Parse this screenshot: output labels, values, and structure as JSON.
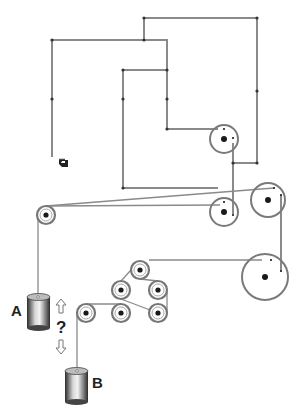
{
  "diagram": {
    "labels": {
      "weight_a": "A",
      "weight_b": "B",
      "question": "?"
    },
    "colors": {
      "line": "#8a8a8a",
      "pulley_ring": "#7a7a7a",
      "axle": "#1a1a1a",
      "weight_dark": "#333333",
      "weight_light": "#e0e0e0"
    },
    "arrows": [
      "up-arrow",
      "down-arrow"
    ],
    "pointer_icon": "pointing-hand-icon",
    "pulleys": [
      {
        "id": "top-right-small",
        "cx": 224,
        "cy": 139,
        "r": 14
      },
      {
        "id": "middle-right-small",
        "cx": 224,
        "cy": 212,
        "r": 14
      },
      {
        "id": "right-medium",
        "cx": 268,
        "cy": 200,
        "r": 17
      },
      {
        "id": "right-large",
        "cx": 265,
        "cy": 277,
        "r": 23
      },
      {
        "id": "left-guide",
        "cx": 46,
        "cy": 215,
        "r": 9
      },
      {
        "id": "cluster-top",
        "cx": 140,
        "cy": 270,
        "r": 9
      },
      {
        "id": "cluster-mid-left",
        "cx": 121,
        "cy": 290,
        "r": 9
      },
      {
        "id": "cluster-mid-right",
        "cx": 158,
        "cy": 290,
        "r": 9
      },
      {
        "id": "cluster-bot-left",
        "cx": 121,
        "cy": 313,
        "r": 9
      },
      {
        "id": "cluster-bot-right",
        "cx": 158,
        "cy": 313,
        "r": 9
      },
      {
        "id": "b-guide",
        "cx": 86,
        "cy": 313,
        "r": 9
      }
    ]
  }
}
